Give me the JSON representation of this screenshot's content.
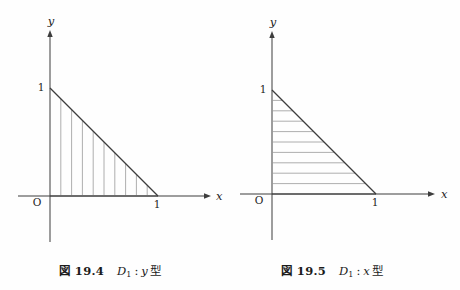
{
  "page": {
    "background": "#fefefe",
    "ink": "#3d3d3d",
    "hatch_color": "#999999",
    "text_color": "#1b1b1b"
  },
  "figures": [
    {
      "id": "fig-19-4",
      "axis_labels": {
        "x": "x",
        "y": "y",
        "origin": "O"
      },
      "tick_labels": {
        "x_one": "1",
        "y_one": "1"
      },
      "region": {
        "name": "D1",
        "shape": "triangle",
        "vertices_xy": [
          [
            0,
            0
          ],
          [
            1,
            0
          ],
          [
            0,
            1
          ]
        ]
      },
      "hatch": {
        "direction": "vertical",
        "positions": [
          0.1,
          0.2,
          0.3,
          0.4,
          0.5,
          0.6,
          0.7,
          0.8,
          0.9
        ]
      },
      "caption": {
        "fig_label": "図 19.4",
        "set": "D",
        "set_sub": "1",
        "sep": ":",
        "variable": "y",
        "suffix": "型"
      }
    },
    {
      "id": "fig-19-5",
      "axis_labels": {
        "x": "x",
        "y": "y",
        "origin": "O"
      },
      "tick_labels": {
        "x_one": "1",
        "y_one": "1"
      },
      "region": {
        "name": "D1",
        "shape": "triangle",
        "vertices_xy": [
          [
            0,
            0
          ],
          [
            1,
            0
          ],
          [
            0,
            1
          ]
        ]
      },
      "hatch": {
        "direction": "horizontal",
        "positions": [
          0.1,
          0.2,
          0.3,
          0.4,
          0.5,
          0.6,
          0.7,
          0.8,
          0.9
        ]
      },
      "caption": {
        "fig_label": "図 19.5",
        "set": "D",
        "set_sub": "1",
        "sep": ":",
        "variable": "x",
        "suffix": "型"
      }
    }
  ]
}
